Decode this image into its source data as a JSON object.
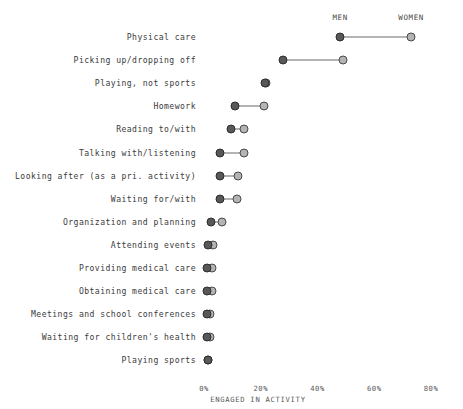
{
  "chart_data": {
    "type": "scatter",
    "chart_style": "dumbbell",
    "title": "",
    "xlabel": "ENGAGED IN ACTIVITY",
    "ylabel": "",
    "xlim": [
      0,
      80
    ],
    "xticks": [
      0,
      20,
      40,
      60,
      80
    ],
    "xtick_labels": [
      "0%",
      "20%",
      "40%",
      "60%",
      "80%"
    ],
    "grid": false,
    "legend_position": "top",
    "categories": [
      "Physical care",
      "Picking up/dropping off",
      "Playing, not sports",
      "Homework",
      "Reading to/with",
      "Talking with/listening",
      "Looking after (as a pri. activity)",
      "Waiting for/with",
      "Organization and planning",
      "Attending events",
      "Providing medical care",
      "Obtaining medical care",
      "Meetings and school conferences",
      "Waiting for children's health",
      "Playing sports"
    ],
    "series": [
      {
        "name": "MEN",
        "color": "#585858",
        "values": [
          48.0,
          28.0,
          21.5,
          11.0,
          9.5,
          5.5,
          5.8,
          5.5,
          2.5,
          1.5,
          1.2,
          1.2,
          1.0,
          1.0,
          1.4
        ]
      },
      {
        "name": "WOMEN",
        "color": "#b4b4b4",
        "values": [
          73.0,
          49.0,
          22.0,
          21.0,
          14.0,
          14.0,
          12.0,
          11.5,
          6.5,
          3.3,
          2.8,
          2.8,
          2.0,
          2.0,
          1.4
        ]
      }
    ]
  },
  "legend": {
    "men_label": "MEN",
    "women_label": "WOMEN"
  },
  "axis": {
    "title": "ENGAGED IN ACTIVITY",
    "tick_0": "0%",
    "tick_1": "20%",
    "tick_2": "40%",
    "tick_3": "60%",
    "tick_4": "80%"
  }
}
